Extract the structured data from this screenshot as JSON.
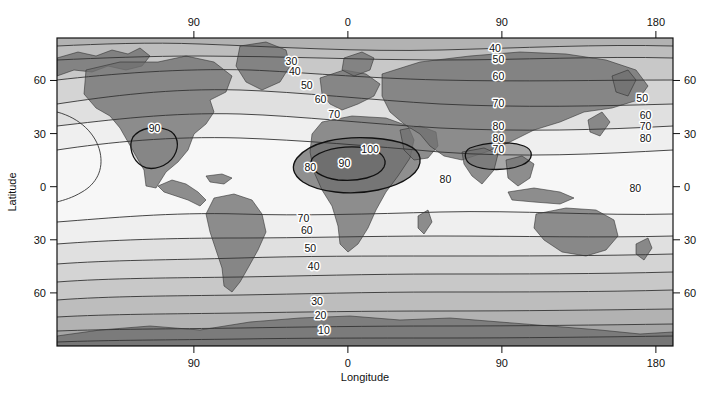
{
  "figure": {
    "type": "contour-map",
    "background": "#ffffff"
  },
  "axes": {
    "x_title": "Longitude",
    "y_title": "Latitude",
    "x_ticks_top": [
      {
        "label": "90",
        "value": -90
      },
      {
        "label": "0",
        "value": 0
      },
      {
        "label": "90",
        "value": 90
      },
      {
        "label": "180",
        "value": 180
      }
    ],
    "x_ticks_bottom": [
      {
        "label": "90",
        "value": -90
      },
      {
        "label": "0",
        "value": 0
      },
      {
        "label": "90",
        "value": 90
      },
      {
        "label": "180",
        "value": 180
      }
    ],
    "y_ticks_left": [
      {
        "label": "60",
        "value": 60
      },
      {
        "label": "30",
        "value": 30
      },
      {
        "label": "0",
        "value": 0
      },
      {
        "label": "30",
        "value": -30
      },
      {
        "label": "60",
        "value": -60
      }
    ],
    "y_ticks_right": [
      {
        "label": "60",
        "value": 60
      },
      {
        "label": "30",
        "value": 30
      },
      {
        "label": "0",
        "value": 0
      },
      {
        "label": "30",
        "value": -30
      },
      {
        "label": "60",
        "value": -60
      }
    ],
    "xlim": [
      -170,
      190
    ],
    "ylim": [
      -90,
      84
    ]
  },
  "chart_data": {
    "type": "heatmap",
    "subtype": "filled-contour-world-map",
    "title": "",
    "xlabel": "Longitude",
    "ylabel": "Latitude",
    "xlim": [
      -170,
      190
    ],
    "ylim": [
      -90,
      84
    ],
    "grid": false,
    "legend": "none",
    "contour_interval": 10,
    "contour_levels": [
      10,
      20,
      30,
      40,
      50,
      60,
      70,
      80,
      90,
      100
    ],
    "value_range": [
      0,
      100
    ],
    "fill_palette": [
      "#4c4c4c",
      "#606060",
      "#767676",
      "#8c8c8c",
      "#a2a2a2",
      "#b4b4b4",
      "#c6c6c6",
      "#d8d8d8",
      "#e8e8e8",
      "#f4f4f4",
      "#fcfcfc"
    ],
    "land_overlay_color": "#6f6f6f",
    "contour_labels": [
      {
        "text": "30",
        "lon": -33,
        "lat": 69
      },
      {
        "text": "40",
        "lon": -31,
        "lat": 63
      },
      {
        "text": "50",
        "lon": -24,
        "lat": 55
      },
      {
        "text": "60",
        "lon": -16,
        "lat": 47
      },
      {
        "text": "70",
        "lon": -8,
        "lat": 39
      },
      {
        "text": "90",
        "lon": -113,
        "lat": 31
      },
      {
        "text": "80",
        "lon": -22,
        "lat": 9
      },
      {
        "text": "70",
        "lon": -26,
        "lat": -20
      },
      {
        "text": "60",
        "lon": -24,
        "lat": -27
      },
      {
        "text": "50",
        "lon": -22,
        "lat": -37
      },
      {
        "text": "40",
        "lon": -20,
        "lat": -47
      },
      {
        "text": "30",
        "lon": -18,
        "lat": -67
      },
      {
        "text": "20",
        "lon": -16,
        "lat": -75
      },
      {
        "text": "10",
        "lon": -14,
        "lat": -83
      },
      {
        "text": "100",
        "lon": 13,
        "lat": 19
      },
      {
        "text": "90",
        "lon": -2,
        "lat": 11
      },
      {
        "text": "40",
        "lon": 86,
        "lat": 76
      },
      {
        "text": "50",
        "lon": 88,
        "lat": 70
      },
      {
        "text": "60",
        "lon": 88,
        "lat": 60
      },
      {
        "text": "70",
        "lon": 88,
        "lat": 45
      },
      {
        "text": "80",
        "lon": 88,
        "lat": 32
      },
      {
        "text": "80",
        "lon": 88,
        "lat": 25
      },
      {
        "text": "70",
        "lon": 88,
        "lat": 19
      },
      {
        "text": "80",
        "lon": 57,
        "lat": 2
      },
      {
        "text": "50",
        "lon": 172,
        "lat": 48
      },
      {
        "text": "60",
        "lon": 174,
        "lat": 38
      },
      {
        "text": "70",
        "lon": 174,
        "lat": 32
      },
      {
        "text": "80",
        "lon": 174,
        "lat": 25
      },
      {
        "text": "80",
        "lon": 168,
        "lat": -3
      }
    ]
  }
}
